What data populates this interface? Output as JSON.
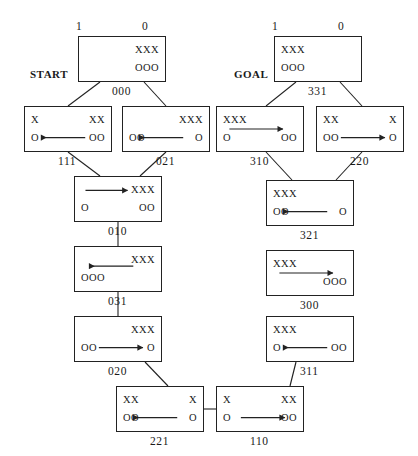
{
  "diagram": {
    "column_headers": [
      {
        "id": "start-col-1",
        "label": "1"
      },
      {
        "id": "start-col-0",
        "label": "0"
      },
      {
        "id": "goal-col-1",
        "label": "1"
      },
      {
        "id": "goal-col-0",
        "label": "0"
      }
    ],
    "annotations": [
      {
        "id": "start-annotation",
        "label": "START"
      },
      {
        "id": "goal-annotation",
        "label": "GOAL"
      }
    ],
    "nodes": [
      {
        "id": "n000",
        "label": "000",
        "tl": "",
        "tr": "XXX",
        "bl": "",
        "br": "OOO",
        "arrow": "none",
        "x": 78,
        "y": 36,
        "w": 88,
        "h": 46
      },
      {
        "id": "n111",
        "label": "111",
        "tl": "X",
        "tr": "XX",
        "bl": "O",
        "br": "OO",
        "arrow": "left",
        "x": 24,
        "y": 106,
        "w": 88,
        "h": 46
      },
      {
        "id": "n021",
        "label": "021",
        "tl": "",
        "tr": "XXX",
        "bl": "OO",
        "br": "O",
        "arrow": "left",
        "x": 122,
        "y": 106,
        "w": 88,
        "h": 46
      },
      {
        "id": "n010",
        "label": "010",
        "tl": "",
        "tr": "XXX",
        "bl": "O",
        "br": "OO",
        "arrow": "right-top",
        "x": 74,
        "y": 176,
        "w": 88,
        "h": 46
      },
      {
        "id": "n031",
        "label": "031",
        "tl": "",
        "tr": "XXX",
        "bl": "OOO",
        "br": "",
        "arrow": "left-top",
        "x": 74,
        "y": 246,
        "w": 88,
        "h": 46
      },
      {
        "id": "n020",
        "label": "020",
        "tl": "",
        "tr": "XXX",
        "bl": "OO",
        "br": "O",
        "arrow": "right",
        "x": 74,
        "y": 316,
        "w": 88,
        "h": 46
      },
      {
        "id": "n221",
        "label": "221",
        "tl": "XX",
        "tr": "X",
        "bl": "OO",
        "br": "O",
        "arrow": "left",
        "x": 116,
        "y": 386,
        "w": 88,
        "h": 46
      },
      {
        "id": "n110",
        "label": "110",
        "tl": "X",
        "tr": "XX",
        "bl": "O",
        "br": "OO",
        "arrow": "right",
        "x": 216,
        "y": 386,
        "w": 88,
        "h": 46
      },
      {
        "id": "n311",
        "label": "311",
        "tl": "XXX",
        "tr": "",
        "bl": "O",
        "br": "OO",
        "arrow": "left",
        "x": 266,
        "y": 316,
        "w": 88,
        "h": 46
      },
      {
        "id": "n300",
        "label": "300",
        "tl": "XXX",
        "tr": "",
        "bl": "",
        "br": "OOO",
        "arrow": "right-mid",
        "x": 266,
        "y": 250,
        "w": 88,
        "h": 46
      },
      {
        "id": "n321",
        "label": "321",
        "tl": "XXX",
        "tr": "",
        "bl": "OO",
        "br": "O",
        "arrow": "left",
        "x": 266,
        "y": 180,
        "w": 88,
        "h": 46
      },
      {
        "id": "n310",
        "label": "310",
        "tl": "XXX",
        "tr": "",
        "bl": "O",
        "br": "OO",
        "arrow": "right-mid",
        "x": 216,
        "y": 106,
        "w": 88,
        "h": 46
      },
      {
        "id": "n220",
        "label": "220",
        "tl": "XX",
        "tr": "X",
        "bl": "OO",
        "br": "O",
        "arrow": "right",
        "x": 316,
        "y": 106,
        "w": 88,
        "h": 46
      },
      {
        "id": "n331",
        "label": "331",
        "tl": "XXX",
        "tr": "",
        "bl": "OOO",
        "br": "",
        "arrow": "none",
        "x": 274,
        "y": 36,
        "w": 88,
        "h": 46
      }
    ],
    "edges": [
      {
        "from": "n000",
        "to": "n111"
      },
      {
        "from": "n000",
        "to": "n021"
      },
      {
        "from": "n111",
        "to": "n010"
      },
      {
        "from": "n021",
        "to": "n010"
      },
      {
        "from": "n010",
        "to": "n031"
      },
      {
        "from": "n031",
        "to": "n020"
      },
      {
        "from": "n020",
        "to": "n221"
      },
      {
        "from": "n221",
        "to": "n110"
      },
      {
        "from": "n110",
        "to": "n311"
      },
      {
        "from": "n331",
        "to": "n310"
      },
      {
        "from": "n331",
        "to": "n220"
      },
      {
        "from": "n310",
        "to": "n321"
      },
      {
        "from": "n220",
        "to": "n321"
      }
    ],
    "colors": {
      "stroke": "#222222",
      "text": "#1a1a1a",
      "background": "#ffffff"
    }
  }
}
